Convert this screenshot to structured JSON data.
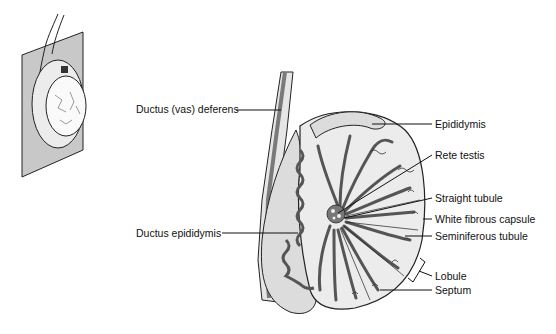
{
  "diagram": {
    "labels": {
      "ductus_deferens": "Ductus (vas) deferens",
      "ductus_epididymis": "Ductus epididymis",
      "epididymis": "Epididymis",
      "rete_testis": "Rete testis",
      "straight_tubule": "Straight tubule",
      "white_fibrous_capsule": "White fibrous capsule",
      "seminiferous_tubule": "Seminiferous tubule",
      "lobule": "Lobule",
      "septum": "Septum"
    },
    "colors": {
      "line": "#1a1a1a",
      "tubule_fill": "#8a8a8a",
      "tissue_fill": "#dcdcdc",
      "plane_fill": "#c8c8c8"
    }
  }
}
